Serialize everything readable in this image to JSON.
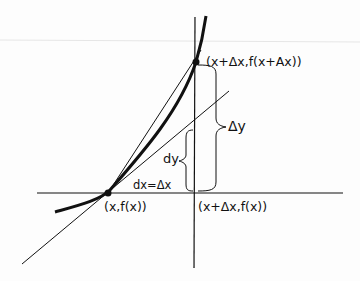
{
  "diagram": {
    "labels": {
      "point_upper": "(x+Δx,f(x+Ax))",
      "point_lower": "(x,f(x))",
      "point_corner": "(x+Δx,f(x))",
      "delta_y": "Δy",
      "dy": "dy",
      "dx_eq": "dx=Δx"
    },
    "elements": [
      "curve y=f(x)",
      "tangent line at (x,f(x))",
      "secant line",
      "horizontal axis line",
      "vertical line at x+Δx",
      "brace Δy",
      "brace dy"
    ],
    "colors": {
      "ink": "#111111",
      "background": "#fdfdfd"
    }
  }
}
